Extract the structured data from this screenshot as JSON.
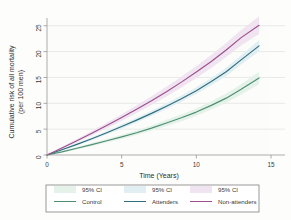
{
  "chart_data": {
    "type": "line",
    "title": "",
    "xlabel": "Time (Years)",
    "ylabel": "Cumulative risk of all mortality (per 100 men)",
    "ylabel_line1": "Cumulative risk of all mortality",
    "ylabel_line2": "(per 100 men)",
    "xlim": [
      0,
      15
    ],
    "ylim": [
      0,
      26.5
    ],
    "xticks": [
      0,
      5,
      10,
      15
    ],
    "xtick_labels": [
      "0",
      "5",
      "10",
      "15"
    ],
    "yticks": [
      0,
      5,
      10,
      15,
      20,
      25
    ],
    "ytick_labels": [
      "0",
      "5",
      "10",
      "15",
      "20",
      "25"
    ],
    "grid": "horizontal",
    "legend_position": "below-plot",
    "x": [
      0,
      1,
      2,
      3,
      4,
      5,
      6,
      7,
      8,
      9,
      10,
      11,
      12,
      13,
      14.2
    ],
    "series": [
      {
        "name": "Control",
        "color": "#4f8f72",
        "ci_color": "#e4f2ea",
        "ci_label": "95% CI",
        "values": [
          0,
          0.6,
          1.3,
          2.0,
          2.75,
          3.5,
          4.3,
          5.2,
          6.2,
          7.2,
          8.3,
          9.6,
          11.0,
          12.7,
          14.9
        ],
        "ci_lower": [
          0,
          0.45,
          1.05,
          1.7,
          2.4,
          3.1,
          3.85,
          4.7,
          5.6,
          6.55,
          7.6,
          8.8,
          10.1,
          11.7,
          13.7
        ],
        "ci_upper": [
          0,
          0.75,
          1.55,
          2.3,
          3.1,
          3.9,
          4.75,
          5.7,
          6.8,
          7.85,
          9.0,
          10.4,
          11.9,
          13.7,
          16.1
        ]
      },
      {
        "name": "Attenders",
        "color": "#2f6e7e",
        "ci_color": "#e2eff2",
        "ci_label": "95% CI",
        "values": [
          0,
          1.0,
          2.05,
          3.15,
          4.3,
          5.5,
          6.75,
          8.05,
          9.45,
          10.9,
          12.45,
          14.2,
          16.1,
          18.4,
          21.1
        ],
        "ci_lower": [
          0,
          0.85,
          1.8,
          2.85,
          3.95,
          5.1,
          6.3,
          7.55,
          8.9,
          10.3,
          11.8,
          13.5,
          15.3,
          17.5,
          20.0
        ],
        "ci_upper": [
          0,
          1.15,
          2.3,
          3.45,
          4.65,
          5.9,
          7.2,
          8.55,
          10.0,
          11.5,
          13.1,
          14.9,
          16.9,
          19.3,
          22.2
        ]
      },
      {
        "name": "Non-attenders",
        "color": "#9c4f8e",
        "ci_color": "#f0e4f1",
        "ci_label": "95% CI",
        "values": [
          0,
          1.35,
          2.75,
          4.2,
          5.7,
          7.25,
          8.85,
          10.5,
          12.25,
          14.1,
          16.05,
          18.1,
          20.3,
          22.7,
          25.1
        ],
        "ci_lower": [
          0,
          1.1,
          2.4,
          3.75,
          5.15,
          6.6,
          8.1,
          9.65,
          11.3,
          13.05,
          14.9,
          16.85,
          18.95,
          21.2,
          23.4
        ],
        "ci_upper": [
          0,
          1.6,
          3.1,
          4.65,
          6.25,
          7.9,
          9.6,
          11.35,
          13.2,
          15.15,
          17.2,
          19.35,
          21.65,
          24.2,
          26.8
        ]
      }
    ],
    "legend_entries": [
      {
        "ci_label": "95% CI",
        "line_label": "Control"
      },
      {
        "ci_label": "95% CI",
        "line_label": "Attenders"
      },
      {
        "ci_label": "95% CI",
        "line_label": "Non-attenders"
      }
    ]
  }
}
